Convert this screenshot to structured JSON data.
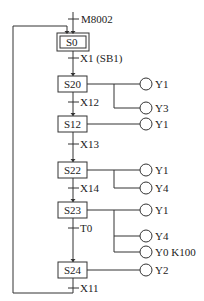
{
  "diagram": {
    "type": "sequential-function-chart",
    "initial_condition": "M8002",
    "steps": [
      {
        "id": "S0",
        "initial": true,
        "y": 33,
        "outputs": []
      },
      {
        "id": "S20",
        "y": 76,
        "outputs": [
          {
            "label": "Y1",
            "y": 84
          },
          {
            "label": "Y3",
            "y": 108
          }
        ]
      },
      {
        "id": "S12",
        "y": 116,
        "outputs": [
          {
            "label": "Y1",
            "y": 124
          }
        ]
      },
      {
        "id": "S22",
        "y": 162,
        "outputs": [
          {
            "label": "Y1",
            "y": 170
          },
          {
            "label": "Y4",
            "y": 188
          }
        ]
      },
      {
        "id": "S23",
        "y": 202,
        "outputs": [
          {
            "label": "Y1",
            "y": 210
          },
          {
            "label": "Y4",
            "y": 236
          },
          {
            "label": "Y0 K100",
            "y": 252
          }
        ]
      },
      {
        "id": "S24",
        "y": 262,
        "outputs": [
          {
            "label": "Y2",
            "y": 270
          }
        ]
      }
    ],
    "transitions": [
      {
        "label": "X1 (SB1)",
        "y": 58
      },
      {
        "label": "X12",
        "y": 102
      },
      {
        "label": "X13",
        "y": 144
      },
      {
        "label": "X14",
        "y": 188
      },
      {
        "label": "T0",
        "y": 228
      },
      {
        "label": "X11",
        "y": 288
      }
    ]
  }
}
